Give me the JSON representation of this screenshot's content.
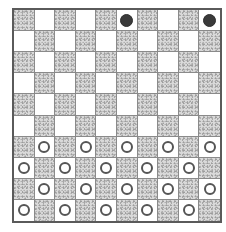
{
  "game": "draughts",
  "board": {
    "rows": 10,
    "cols": 10,
    "dark_square_rule": "(row+col) even",
    "colors": {
      "border": "#5a5a5a",
      "grid_line": "#8a8a8a",
      "dark_square": "#d9d9d9",
      "light_square": "#ffffff",
      "black_piece": "#3a3a3a",
      "white_piece_outline": "#555555"
    }
  },
  "pieces": {
    "black": [
      {
        "row": 0,
        "col": 5
      },
      {
        "row": 0,
        "col": 9
      }
    ],
    "white": [
      {
        "row": 6,
        "col": 1
      },
      {
        "row": 6,
        "col": 3
      },
      {
        "row": 6,
        "col": 5
      },
      {
        "row": 6,
        "col": 7
      },
      {
        "row": 6,
        "col": 9
      },
      {
        "row": 7,
        "col": 0
      },
      {
        "row": 7,
        "col": 2
      },
      {
        "row": 7,
        "col": 4
      },
      {
        "row": 7,
        "col": 6
      },
      {
        "row": 7,
        "col": 8
      },
      {
        "row": 8,
        "col": 1
      },
      {
        "row": 8,
        "col": 3
      },
      {
        "row": 8,
        "col": 5
      },
      {
        "row": 8,
        "col": 7
      },
      {
        "row": 8,
        "col": 9
      },
      {
        "row": 9,
        "col": 0
      },
      {
        "row": 9,
        "col": 2
      },
      {
        "row": 9,
        "col": 4
      },
      {
        "row": 9,
        "col": 6
      },
      {
        "row": 9,
        "col": 8
      }
    ]
  },
  "piece_counts": {
    "black": 2,
    "white": 20
  }
}
